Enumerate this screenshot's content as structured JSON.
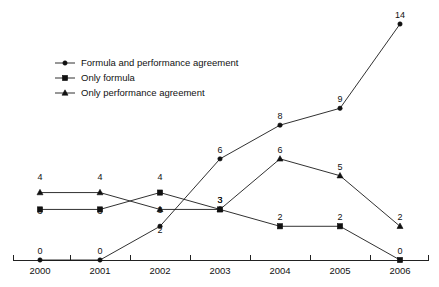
{
  "chart_data": {
    "type": "line",
    "title": "",
    "subtitle": "",
    "xlabel": "",
    "ylabel": "",
    "categories": [
      "2000",
      "2001",
      "2002",
      "2003",
      "2004",
      "2005",
      "2006"
    ],
    "x": [
      2000,
      2001,
      2002,
      2003,
      2004,
      2005,
      2006
    ],
    "ylim": [
      0,
      14
    ],
    "xlim": [
      2000,
      2006
    ],
    "grid": false,
    "legend_position": "top-left",
    "axes": {
      "x_axis_visible": true,
      "y_axis_visible": false,
      "x_tick_labels": [
        "2000",
        "2001",
        "2002",
        "2003",
        "2004",
        "2005",
        "2006"
      ],
      "y_tick_labels": []
    },
    "data_labels_shown": true,
    "series": [
      {
        "name": "Formula and performance agreement",
        "marker": "dot",
        "values": [
          0,
          0,
          2,
          6,
          8,
          9,
          14
        ],
        "labels": [
          "0",
          "0",
          "2",
          "6",
          "8",
          "9",
          "14"
        ]
      },
      {
        "name": "Only formula",
        "marker": "square",
        "values": [
          3,
          3,
          4,
          3,
          2,
          2,
          0
        ],
        "labels": [
          "3",
          "3",
          "4",
          "3",
          "2",
          "2",
          "0"
        ]
      },
      {
        "name": "Only performance agreement",
        "marker": "triangle",
        "values": [
          4,
          4,
          3,
          3,
          6,
          5,
          2
        ],
        "labels": [
          "4",
          "4",
          "3",
          "3",
          "6",
          "5",
          "2"
        ]
      }
    ],
    "colors": {
      "line": "#1a1a1a",
      "marker": "#111111",
      "axis": "#222222",
      "text": "#111111",
      "background": "#ffffff"
    }
  },
  "legend": {
    "entries": [
      {
        "label": "Formula and performance agreement",
        "marker": "dot"
      },
      {
        "label": "Only formula",
        "marker": "square"
      },
      {
        "label": "Only performance agreement",
        "marker": "triangle"
      }
    ]
  }
}
